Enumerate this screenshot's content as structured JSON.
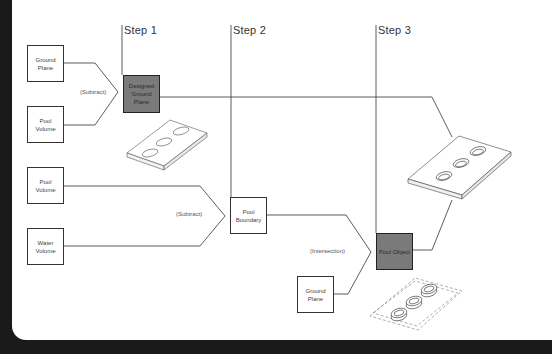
{
  "steps": [
    {
      "label": "Step 1"
    },
    {
      "label": "Step 2"
    },
    {
      "label": "Step 3"
    }
  ],
  "boxes": {
    "ground_plane_1": "Ground Plane",
    "pool_volume_1": "Pool Volume",
    "designed_ground_plane": "Designed Ground Plane",
    "pool_volume_2": "Pool Volume",
    "water_volume": "Water Volume",
    "pool_boundary": "Pool Boundary",
    "ground_plane_2": "Ground Plane",
    "pool_object": "Pool Object"
  },
  "operations": {
    "op1": "(Subtract)",
    "op2": "(Subtract)",
    "op3": "(Intersection)"
  },
  "colors": {
    "result_box_fill": "#7a7a7a",
    "line": "#333333",
    "background": "#ffffff",
    "frame": "#1a1a1a"
  }
}
